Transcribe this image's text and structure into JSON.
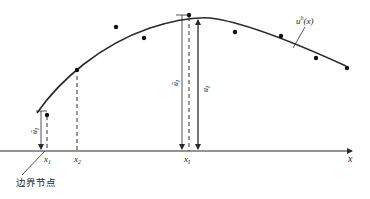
{
  "diagram": {
    "curve_label": "u",
    "curve_label_sup": "h",
    "curve_label_arg": "(x)",
    "x_axis_label": "x",
    "x_ticks": [
      {
        "name": "x",
        "sub": "1"
      },
      {
        "name": "x",
        "sub": "2"
      },
      {
        "name": "x",
        "sub": "I"
      }
    ],
    "dim_labels": {
      "left_bar": "ū",
      "left_sub": "I",
      "mid_bar": "ū",
      "mid_sub": "I",
      "right": "u",
      "right_sub": "I"
    },
    "boundary_node_label": "边界节点"
  },
  "colors": {
    "ink": "#2a2a2a",
    "background": "#ffffff"
  }
}
